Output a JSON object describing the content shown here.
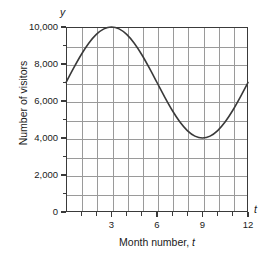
{
  "chart_data": {
    "type": "line",
    "title": "",
    "xlabel": "Month number, t",
    "ylabel": "Number of visitors",
    "x_axis_symbol": "t",
    "y_axis_symbol": "y",
    "xlim": [
      0,
      12
    ],
    "ylim": [
      0,
      10000
    ],
    "grid": true,
    "legend_position": "none",
    "x_major_ticks": [
      3,
      6,
      9,
      12
    ],
    "x_major_tick_labels": [
      "3",
      "6",
      "9",
      "12"
    ],
    "x_minor_ticks": [
      1,
      2,
      4,
      5,
      7,
      8,
      10,
      11
    ],
    "y_major_ticks": [
      0,
      2000,
      4000,
      6000,
      8000,
      10000
    ],
    "y_major_tick_labels": [
      "0",
      "2,000",
      "4,000",
      "6,000",
      "8,000",
      "10,000"
    ],
    "y_minor_ticks": [
      1000,
      3000,
      5000,
      7000,
      9000
    ],
    "series": [
      {
        "name": "Number of visitors",
        "color": "#3a3a3a",
        "description": "Sinusoidal curve, midline 7,000, amplitude 3,000, period 12 months, maximum 10,000 at t=3, minimum 4,000 at t=9",
        "x": [
          0,
          0.5,
          1,
          1.5,
          2,
          2.5,
          3,
          3.5,
          4,
          4.5,
          5,
          5.5,
          6,
          6.5,
          7,
          7.5,
          8,
          8.5,
          9,
          9.5,
          10,
          10.5,
          11,
          11.5,
          12
        ],
        "values": [
          7000,
          7776,
          8500,
          9121,
          9598,
          9898,
          10000,
          9898,
          9598,
          9121,
          8500,
          7776,
          7000,
          6224,
          5500,
          4879,
          4402,
          4102,
          4000,
          4102,
          4402,
          4879,
          5500,
          6224,
          7000
        ]
      }
    ]
  },
  "figure": {
    "grid_color": "#9a9a9a",
    "frame_color": "#3a3a3a",
    "background": "#ffffff"
  }
}
